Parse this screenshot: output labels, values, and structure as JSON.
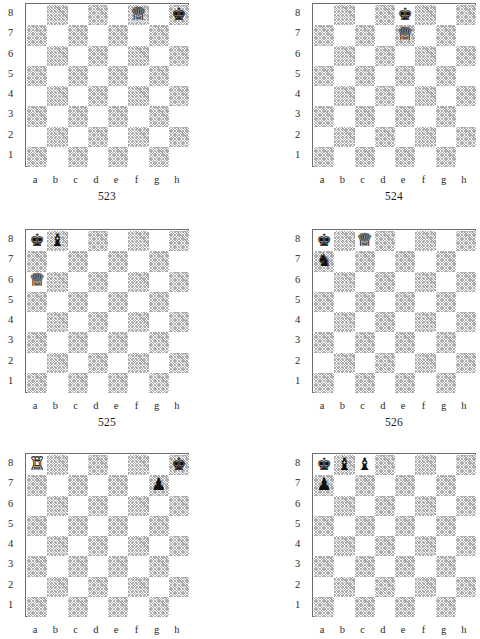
{
  "page": {
    "kind": "chess-problem-diagram-sheet",
    "background_color": "#ffffff",
    "dark_square_color": "#b0b0b0",
    "light_square_color": "#ffffff",
    "border_color": "#6e6e6e"
  },
  "labels": {
    "files": [
      "a",
      "b",
      "c",
      "d",
      "e",
      "f",
      "g",
      "h"
    ],
    "ranks": [
      "8",
      "7",
      "6",
      "5",
      "4",
      "3",
      "2",
      "1"
    ]
  },
  "glyphs": {
    "white-king": "♔",
    "white-queen": "♕",
    "white-rook": "♖",
    "white-bishop": "♗",
    "white-knight": "♘",
    "white-pawn": "♙",
    "black-king": "♚",
    "black-queen": "♛",
    "black-rook": "♜",
    "black-bishop": "♝",
    "black-knight": "♞",
    "black-pawn": "♟"
  },
  "diagrams": [
    {
      "caption": "523",
      "position": "row-1 col-left",
      "clipped": false,
      "pieces": [
        {
          "square": "f8",
          "piece": "white-queen",
          "color": "white",
          "name": "white-queen-f8"
        },
        {
          "square": "h8",
          "piece": "black-king",
          "color": "black",
          "name": "black-king-h8"
        }
      ]
    },
    {
      "caption": "524",
      "position": "row-1 col-right",
      "clipped": false,
      "pieces": [
        {
          "square": "e8",
          "piece": "black-king",
          "color": "black",
          "name": "black-king-e8"
        },
        {
          "square": "e7",
          "piece": "white-queen",
          "color": "white",
          "name": "white-queen-e7"
        }
      ]
    },
    {
      "caption": "525",
      "position": "row-2 col-left",
      "clipped": false,
      "pieces": [
        {
          "square": "a8",
          "piece": "black-king",
          "color": "black",
          "name": "black-king-a8"
        },
        {
          "square": "b8",
          "piece": "black-bishop",
          "color": "black",
          "name": "black-bishop-b8"
        },
        {
          "square": "a6",
          "piece": "white-queen",
          "color": "white",
          "name": "white-queen-a6"
        }
      ]
    },
    {
      "caption": "526",
      "position": "row-2 col-right",
      "clipped": false,
      "pieces": [
        {
          "square": "a8",
          "piece": "black-king",
          "color": "black",
          "name": "black-king-a8"
        },
        {
          "square": "c8",
          "piece": "white-queen",
          "color": "white",
          "name": "white-queen-c8"
        },
        {
          "square": "a7",
          "piece": "black-knight",
          "color": "black",
          "name": "black-knight-a7"
        }
      ]
    },
    {
      "caption": "",
      "position": "row-3 col-left",
      "clipped": true,
      "pieces": [
        {
          "square": "a8",
          "piece": "white-rook",
          "color": "white",
          "name": "white-rook-a8"
        },
        {
          "square": "h8",
          "piece": "black-king",
          "color": "black",
          "name": "black-king-h8"
        },
        {
          "square": "g7",
          "piece": "black-pawn",
          "color": "black",
          "name": "black-pawn-g7"
        }
      ]
    },
    {
      "caption": "",
      "position": "row-3 col-right",
      "clipped": true,
      "pieces": [
        {
          "square": "a8",
          "piece": "black-king",
          "color": "black",
          "name": "black-king-a8"
        },
        {
          "square": "b8",
          "piece": "black-bishop",
          "color": "black",
          "name": "black-bishop-b8"
        },
        {
          "square": "c8",
          "piece": "black-bishop",
          "color": "black",
          "name": "black-bishop-c8"
        },
        {
          "square": "a7",
          "piece": "black-pawn",
          "color": "black",
          "name": "black-pawn-a7"
        }
      ]
    }
  ]
}
